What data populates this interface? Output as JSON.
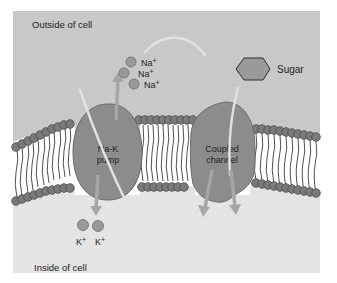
{
  "diagram": {
    "regions": {
      "outside_label": "Outside of cell",
      "inside_label": "Inside of cell"
    },
    "proteins": [
      {
        "id": "na-k-pump",
        "label_line1": "Na-K",
        "label_line2": "pump"
      },
      {
        "id": "coupled-channel",
        "label_line1": "Coupled",
        "label_line2": "channel"
      }
    ],
    "ions": {
      "sodium": [
        "Na+",
        "Na+",
        "Na+"
      ],
      "potassium": [
        "K+",
        "K+"
      ]
    },
    "molecules": {
      "sugar_label": "Sugar"
    },
    "ion_symbols": {
      "na_base": "Na",
      "k_base": "K",
      "plus": "+"
    },
    "colors": {
      "outside_bg": "#c8c8c8",
      "inside_bg": "#e4e4e4",
      "membrane_core": "#ffffff",
      "lipid_head": "#7a7a7a",
      "lipid_head_stroke": "#4a4a4a",
      "protein": "#8c8c8c",
      "protein_stroke": "#6a6a6a",
      "arrow": "#a6a6a6",
      "arrow_light": "#dcdcdc",
      "ion": "#9a9a9a",
      "text": "#222222"
    }
  }
}
